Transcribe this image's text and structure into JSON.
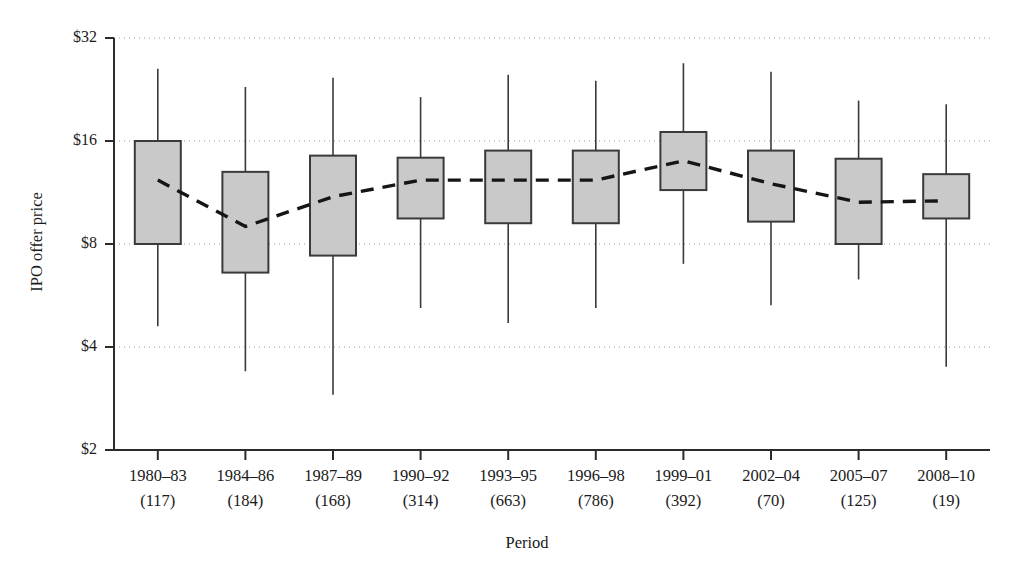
{
  "chart_data": {
    "type": "box",
    "title": "",
    "xlabel": "Period",
    "ylabel": "IPO offer price",
    "yscale": "log2",
    "ylim": [
      2,
      32
    ],
    "yticks": [
      2,
      4,
      8,
      16,
      32
    ],
    "ytick_labels": [
      "$2",
      "$4",
      "$8",
      "$16",
      "$32"
    ],
    "grid": "horizontal-dotted",
    "legend": "none",
    "categories": [
      "1980–83",
      "1984–86",
      "1987–89",
      "1990–92",
      "1993–95",
      "1996–98",
      "1999–01",
      "2002–04",
      "2005–07",
      "2008–10"
    ],
    "counts": [
      117,
      184,
      168,
      314,
      663,
      786,
      392,
      70,
      125,
      19
    ],
    "count_labels": [
      "(117)",
      "(184)",
      "(168)",
      "(314)",
      "(663)",
      "(786)",
      "(392)",
      "(70)",
      "(125)",
      "(19)"
    ],
    "boxes": [
      {
        "period": "1980–83",
        "whisker_low": 4.6,
        "q1": 8.0,
        "q3": 16.0,
        "whisker_high": 26.0
      },
      {
        "period": "1984–86",
        "whisker_low": 3.4,
        "q1": 6.6,
        "q3": 13.0,
        "whisker_high": 23.0
      },
      {
        "period": "1987–89",
        "whisker_low": 2.9,
        "q1": 7.4,
        "q3": 14.5,
        "whisker_high": 24.5
      },
      {
        "period": "1990–92",
        "whisker_low": 5.2,
        "q1": 9.5,
        "q3": 14.3,
        "whisker_high": 21.5
      },
      {
        "period": "1993–95",
        "whisker_low": 4.7,
        "q1": 9.2,
        "q3": 15.0,
        "whisker_high": 25.0
      },
      {
        "period": "1996–98",
        "whisker_low": 5.2,
        "q1": 9.2,
        "q3": 15.0,
        "whisker_high": 24.0
      },
      {
        "period": "1999–01",
        "whisker_low": 7.0,
        "q1": 11.5,
        "q3": 17.0,
        "whisker_high": 27.0
      },
      {
        "period": "2002–04",
        "whisker_low": 5.3,
        "q1": 9.3,
        "q3": 15.0,
        "whisker_high": 25.5
      },
      {
        "period": "2005–07",
        "whisker_low": 6.3,
        "q1": 8.0,
        "q3": 14.2,
        "whisker_high": 21.0
      },
      {
        "period": "2008–10",
        "whisker_low": 3.5,
        "q1": 9.5,
        "q3": 12.8,
        "whisker_high": 20.5
      }
    ],
    "mean_series": {
      "name": "mean offer price",
      "style": "dashed",
      "values": [
        12.3,
        9.0,
        11.0,
        12.3,
        12.3,
        12.3,
        14.0,
        12.0,
        10.6,
        10.7
      ]
    }
  }
}
